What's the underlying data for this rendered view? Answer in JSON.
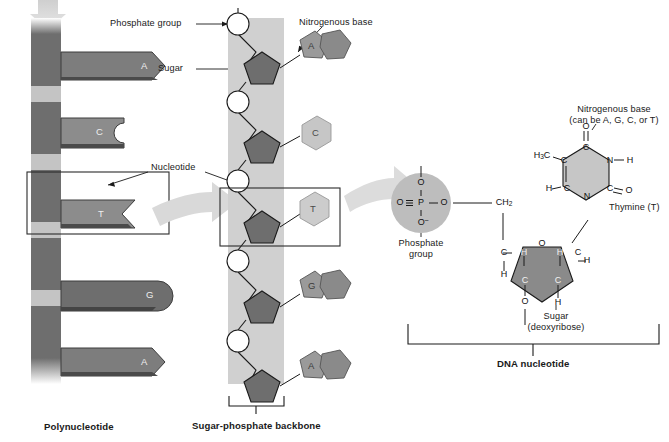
{
  "figure": {
    "title_hidden": "",
    "panels": {
      "left": {
        "caption": "Polynucleotide",
        "bases": [
          {
            "label": "A",
            "type": "purine-arrow"
          },
          {
            "label": "C",
            "type": "pyrimidine-notch"
          },
          {
            "label": "T",
            "type": "pyrimidine-notch"
          },
          {
            "label": "G",
            "type": "purine-round"
          },
          {
            "label": "A",
            "type": "purine-arrow"
          }
        ]
      },
      "middle": {
        "caption": "Sugar-phosphate backbone",
        "bases": [
          {
            "label": "A",
            "ring": "double"
          },
          {
            "label": "C",
            "ring": "single"
          },
          {
            "label": "T",
            "ring": "single"
          },
          {
            "label": "G",
            "ring": "double"
          },
          {
            "label": "A",
            "ring": "double"
          }
        ]
      },
      "right": {
        "caption": "DNA nucleotide"
      }
    },
    "callouts": {
      "phosphate_group": "Phosphate group",
      "sugar": "Sugar",
      "nucleotide": "Nucleotide",
      "nitrogenous_base": "Nitrogenous base",
      "nitrogenous_base_detail_line1": "Nitrogenous base",
      "nitrogenous_base_detail_line2": "(can be A, G, C, or T)",
      "thymine": "Thymine (T)",
      "phosphate_group_detail_line1": "Phosphate",
      "phosphate_group_detail_line2": "group",
      "sugar_detail_line1": "Sugar",
      "sugar_detail_line2": "(deoxyribose)"
    },
    "chemistry": {
      "phosphate": {
        "top_o": "O",
        "left_o": "O",
        "p": "P",
        "right_o": "O",
        "bottom_o": "O",
        "bottom_o_charge": "–"
      },
      "sugar": {
        "ch2": "CH",
        "ch2_sub": "2",
        "ring_o": "O",
        "c_left": "C",
        "c_right": "C",
        "c_bottom_left": "C",
        "c_bottom_right": "C",
        "h_left_upper": "H",
        "h_right_upper": "H",
        "h_left_lower": "H",
        "h_right_lower": "H",
        "h_bottom_right": "H",
        "o_bottom": "O"
      },
      "thymine": {
        "h3c": "H",
        "h3c_sub": "3",
        "h3c_rest": "C",
        "c_upper_left": "C",
        "c_top": "C",
        "n_right_upper": "N",
        "h_right": "H",
        "o_top": "O",
        "c_lower_left": "C",
        "h_left": "H",
        "n_bottom": "N",
        "c_right_lower": "C",
        "o_right": "O"
      }
    },
    "colors": {
      "backbone_dark": "#6e6e6e",
      "backbone_light": "#bdbdbd",
      "base_dark": "#6e6e6e",
      "base_mid": "#8d8d8d",
      "base_light": "#bbbbbb",
      "band": "#c9c9c9",
      "arrow_gray": "#d5d5d5",
      "sugar_fill": "#8a8a8a",
      "thymine_fill": "#c6c6c6",
      "phosphate_fill": "#bdbdbd",
      "line": "#1a1a1a"
    }
  }
}
